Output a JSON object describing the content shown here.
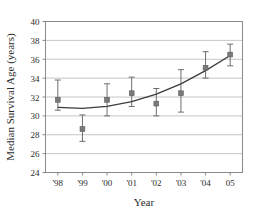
{
  "chart_data": {
    "type": "scatter",
    "title": "",
    "xlabel": "Year",
    "ylabel": "Median Survival Age (years)",
    "categories": [
      "'98",
      "'99",
      "'00",
      "'01",
      "'02",
      "'03",
      "'04",
      "05"
    ],
    "x": [
      1998,
      1999,
      2000,
      2001,
      2002,
      2003,
      2004,
      2005
    ],
    "values": [
      31.7,
      28.6,
      31.7,
      32.4,
      31.3,
      32.4,
      35.1,
      36.5
    ],
    "error_low": [
      30.6,
      27.3,
      30.0,
      31.0,
      30.0,
      30.4,
      34.0,
      35.3
    ],
    "error_high": [
      33.8,
      30.1,
      33.4,
      34.1,
      32.9,
      34.9,
      36.8,
      37.6
    ],
    "trend_name": "fitted trend curve",
    "trend_x": [
      1998,
      1999,
      2000,
      2001,
      2002,
      2003,
      2004,
      2005
    ],
    "trend_values": [
      30.9,
      30.8,
      31.0,
      31.5,
      32.3,
      33.4,
      34.8,
      36.4
    ],
    "ylim": [
      24,
      40
    ],
    "yticks": [
      24,
      26,
      28,
      30,
      32,
      34,
      36,
      38,
      40
    ],
    "ytick_labels": [
      "24",
      "26",
      "28",
      "30",
      "32",
      "34",
      "36",
      "38",
      "40"
    ],
    "xlim": [
      1997.5,
      2005.5
    ],
    "grid": "horizontal",
    "legend": "none",
    "marker": "filled-square",
    "marker_color": "#7a7a7a",
    "line_color": "#3c3c3c",
    "axis_color": "#8a8a8a",
    "grid_color": "#b8b8b8"
  }
}
